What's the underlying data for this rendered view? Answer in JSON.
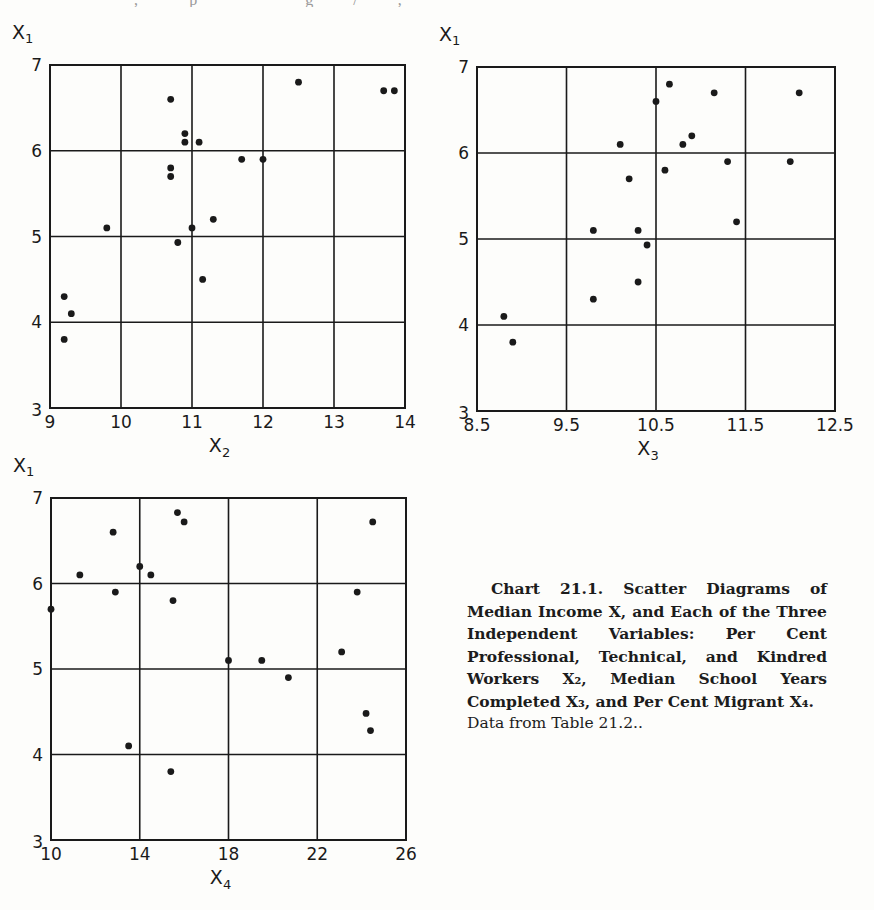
{
  "page": {
    "cutoff_text": "· · · , · · · ·  p · · · · · · · · · g · · ·  / · · · ,  · ·"
  },
  "caption": {
    "title": "Chart 21.1. Scatter Diagrams of Median Income X, and Each of the Three Independent Variables: Per Cent Professional, Technical, and Kindred Workers X₂, Median School Years Completed X₃, and Per Cent Migrant X₄.",
    "source": "Data from Table 21.2.."
  },
  "chart_data": [
    {
      "type": "scatter",
      "title": "",
      "xlabel": "X₂",
      "ylabel": "X₁",
      "xlabel_main": "X",
      "xlabel_sub": "2",
      "ylabel_main": "X",
      "ylabel_sub": "1",
      "xlim": [
        9,
        14
      ],
      "ylim": [
        3,
        7
      ],
      "xticks": [
        9,
        10,
        11,
        12,
        13,
        14
      ],
      "xtick_labels": [
        "9",
        "10",
        "11",
        "12",
        "13",
        "14"
      ],
      "yticks": [
        3,
        4,
        5,
        6,
        7
      ],
      "ytick_labels": [
        "3",
        "4",
        "5",
        "6",
        "7"
      ],
      "grid": true,
      "legend": null,
      "points": [
        {
          "x": 10.7,
          "y": 6.6
        },
        {
          "x": 12.5,
          "y": 6.8
        },
        {
          "x": 13.7,
          "y": 6.7
        },
        {
          "x": 13.85,
          "y": 6.7
        },
        {
          "x": 10.9,
          "y": 6.2
        },
        {
          "x": 10.9,
          "y": 6.1
        },
        {
          "x": 11.1,
          "y": 6.1
        },
        {
          "x": 11.7,
          "y": 5.9
        },
        {
          "x": 12.0,
          "y": 5.9
        },
        {
          "x": 10.7,
          "y": 5.8
        },
        {
          "x": 10.7,
          "y": 5.7
        },
        {
          "x": 9.8,
          "y": 5.1
        },
        {
          "x": 11.0,
          "y": 5.1
        },
        {
          "x": 11.3,
          "y": 5.2
        },
        {
          "x": 10.8,
          "y": 4.93
        },
        {
          "x": 11.15,
          "y": 4.5
        },
        {
          "x": 9.2,
          "y": 4.3
        },
        {
          "x": 9.3,
          "y": 4.1
        },
        {
          "x": 9.2,
          "y": 3.8
        }
      ]
    },
    {
      "type": "scatter",
      "title": "",
      "xlabel": "X₃",
      "ylabel": "X₁",
      "xlabel_main": "X",
      "xlabel_sub": "3",
      "ylabel_main": "X",
      "ylabel_sub": "1",
      "xlim": [
        8.5,
        12.5
      ],
      "ylim": [
        3,
        7
      ],
      "xticks": [
        8.5,
        9.5,
        10.5,
        11.5,
        12.5
      ],
      "xtick_labels": [
        "8.5",
        "9.5",
        "10.5",
        "11.5",
        "12.5"
      ],
      "yticks": [
        3,
        4,
        5,
        6,
        7
      ],
      "ytick_labels": [
        "3",
        "4",
        "5",
        "6",
        "7"
      ],
      "grid": true,
      "legend": null,
      "points": [
        {
          "x": 10.65,
          "y": 6.8
        },
        {
          "x": 11.15,
          "y": 6.7
        },
        {
          "x": 12.1,
          "y": 6.7
        },
        {
          "x": 10.5,
          "y": 6.6
        },
        {
          "x": 10.1,
          "y": 6.1
        },
        {
          "x": 10.8,
          "y": 6.1
        },
        {
          "x": 10.9,
          "y": 6.2
        },
        {
          "x": 11.3,
          "y": 5.9
        },
        {
          "x": 12.0,
          "y": 5.9
        },
        {
          "x": 10.6,
          "y": 5.8
        },
        {
          "x": 10.2,
          "y": 5.7
        },
        {
          "x": 9.8,
          "y": 5.1
        },
        {
          "x": 10.3,
          "y": 5.1
        },
        {
          "x": 11.4,
          "y": 5.2
        },
        {
          "x": 10.4,
          "y": 4.93
        },
        {
          "x": 10.3,
          "y": 4.5
        },
        {
          "x": 9.8,
          "y": 4.3
        },
        {
          "x": 8.8,
          "y": 4.1
        },
        {
          "x": 8.9,
          "y": 3.8
        }
      ]
    },
    {
      "type": "scatter",
      "title": "",
      "xlabel": "X₄",
      "ylabel": "X₁",
      "xlabel_main": "X",
      "xlabel_sub": "4",
      "ylabel_main": "X",
      "ylabel_sub": "1",
      "xlim": [
        10,
        26
      ],
      "ylim": [
        3,
        7
      ],
      "xticks": [
        10,
        14,
        18,
        22,
        26
      ],
      "xtick_labels": [
        "10",
        "14",
        "18",
        "22",
        "26"
      ],
      "yticks": [
        3,
        4,
        5,
        6,
        7
      ],
      "ytick_labels": [
        "3",
        "4",
        "5",
        "6",
        "7"
      ],
      "grid": true,
      "legend": null,
      "points": [
        {
          "x": 15.7,
          "y": 6.83
        },
        {
          "x": 16.0,
          "y": 6.72
        },
        {
          "x": 12.8,
          "y": 6.6
        },
        {
          "x": 24.5,
          "y": 6.72
        },
        {
          "x": 11.3,
          "y": 6.1
        },
        {
          "x": 14.0,
          "y": 6.2
        },
        {
          "x": 14.5,
          "y": 6.1
        },
        {
          "x": 12.9,
          "y": 5.9
        },
        {
          "x": 15.5,
          "y": 5.8
        },
        {
          "x": 10.0,
          "y": 5.7
        },
        {
          "x": 23.8,
          "y": 5.9
        },
        {
          "x": 23.1,
          "y": 5.2
        },
        {
          "x": 18.0,
          "y": 5.1
        },
        {
          "x": 19.5,
          "y": 5.1
        },
        {
          "x": 20.7,
          "y": 4.9
        },
        {
          "x": 24.2,
          "y": 4.48
        },
        {
          "x": 24.4,
          "y": 4.28
        },
        {
          "x": 13.5,
          "y": 4.1
        },
        {
          "x": 15.4,
          "y": 3.8
        }
      ]
    }
  ]
}
